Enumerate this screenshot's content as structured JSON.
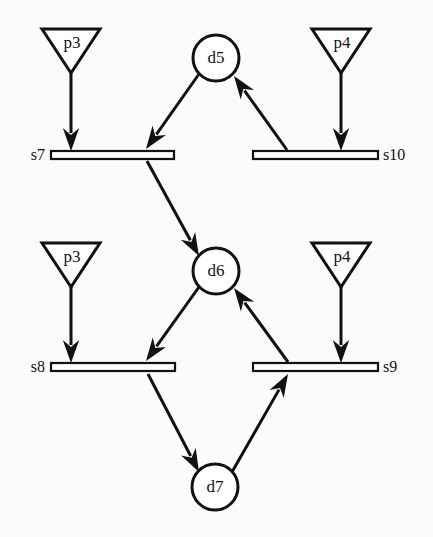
{
  "diagram": {
    "canvas": {
      "width": 433,
      "height": 537,
      "background": "#fbfbfa"
    },
    "colors": {
      "stroke": "#111111",
      "fill": "#ffffff",
      "text": "#141414"
    },
    "places": [
      {
        "id": "p3_top",
        "label": "p3",
        "cx": 71,
        "cy": 29,
        "apex_y": 73,
        "half_width": 29
      },
      {
        "id": "p4_top",
        "label": "p4",
        "cx": 341,
        "cy": 29,
        "apex_y": 73,
        "half_width": 29
      },
      {
        "id": "p3_bottom",
        "label": "p3",
        "cx": 71,
        "cy": 243,
        "apex_y": 287,
        "half_width": 29
      },
      {
        "id": "p4_bottom",
        "label": "p4",
        "cx": 341,
        "cy": 243,
        "apex_y": 287,
        "half_width": 29
      }
    ],
    "transitions": [
      {
        "id": "s7",
        "label": "s7",
        "x1": 51,
        "x2": 174,
        "y": 155,
        "label_x": 22,
        "label_anchor": "left"
      },
      {
        "id": "s10",
        "label": "s10",
        "x1": 253,
        "x2": 378,
        "y": 155,
        "label_x": 383,
        "label_anchor": "right"
      },
      {
        "id": "s8",
        "label": "s8",
        "x1": 51,
        "x2": 175,
        "y": 367,
        "label_x": 22,
        "label_anchor": "left"
      },
      {
        "id": "s9",
        "label": "s9",
        "x1": 253,
        "x2": 378,
        "y": 367,
        "label_x": 383,
        "label_anchor": "right"
      }
    ],
    "decisions": [
      {
        "id": "d5",
        "label": "d5",
        "cx": 216,
        "cy": 58,
        "r": 23
      },
      {
        "id": "d6",
        "label": "d6",
        "cx": 216,
        "cy": 271,
        "r": 23
      },
      {
        "id": "d7",
        "label": "d7",
        "cx": 215,
        "cy": 487,
        "r": 23
      }
    ],
    "edges": [
      {
        "id": "e1",
        "from": "p3_top",
        "to": "s7",
        "x1": 71,
        "y1": 73,
        "x2": 71,
        "y2": 151
      },
      {
        "id": "e2",
        "from": "p4_top",
        "to": "s10",
        "x1": 341,
        "y1": 73,
        "x2": 341,
        "y2": 151
      },
      {
        "id": "e3",
        "from": "p3_bottom",
        "to": "s8",
        "x1": 71,
        "y1": 287,
        "x2": 71,
        "y2": 363
      },
      {
        "id": "e4",
        "from": "p4_bottom",
        "to": "s9",
        "x1": 341,
        "y1": 287,
        "x2": 341,
        "y2": 363
      },
      {
        "id": "e5",
        "from": "d5",
        "to": "s7",
        "x1": 199,
        "y1": 74,
        "x2": 146,
        "y2": 149
      },
      {
        "id": "e6",
        "from": "s10",
        "to": "d5",
        "x1": 287,
        "y1": 150,
        "x2": 234,
        "y2": 76
      },
      {
        "id": "e7",
        "from": "s7",
        "to": "d6",
        "x1": 147,
        "y1": 161,
        "x2": 199,
        "y2": 256
      },
      {
        "id": "e8",
        "from": "s9",
        "to": "d6",
        "x1": 288,
        "y1": 362,
        "x2": 234,
        "y2": 288
      },
      {
        "id": "e9",
        "from": "d6",
        "to": "s8",
        "x1": 199,
        "y1": 287,
        "x2": 146,
        "y2": 361
      },
      {
        "id": "e10",
        "from": "s8",
        "to": "d7",
        "x1": 148,
        "y1": 374,
        "x2": 199,
        "y2": 472
      },
      {
        "id": "e11",
        "from": "d7",
        "to": "s9",
        "x1": 232,
        "y1": 472,
        "x2": 288,
        "y2": 374
      }
    ]
  }
}
